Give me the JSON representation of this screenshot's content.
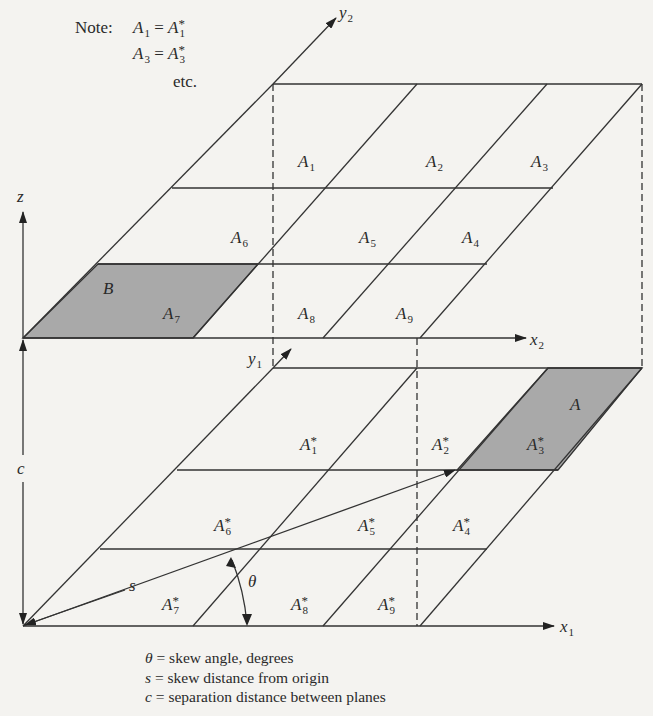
{
  "diagram": {
    "type": "two parallel skewed grid planes",
    "colors": {
      "background": "#f4f3f0",
      "line": "#333333",
      "shade": "#a9a9a9"
    },
    "note": {
      "prefix": "Note:",
      "lines": [
        {
          "lhs": "A",
          "lhs_sub": "1",
          "rhs": "A",
          "rhs_sup": "*",
          "rhs_sub": "1"
        },
        {
          "lhs": "A",
          "lhs_sub": "3",
          "rhs": "A",
          "rhs_sup": "*",
          "rhs_sub": "3"
        }
      ],
      "etc": "etc.",
      "eq": "="
    },
    "axes": {
      "z": "z",
      "y2": {
        "base": "y",
        "sub": "2"
      },
      "x2": {
        "base": "x",
        "sub": "2"
      },
      "y1": {
        "base": "y",
        "sub": "1"
      },
      "x1": {
        "base": "x",
        "sub": "1"
      },
      "c": "c",
      "s": "s",
      "theta": "θ"
    },
    "top_plane_cells": [
      {
        "base": "A",
        "sub": "1"
      },
      {
        "base": "A",
        "sub": "2"
      },
      {
        "base": "A",
        "sub": "3"
      },
      {
        "base": "A",
        "sub": "6"
      },
      {
        "base": "A",
        "sub": "5"
      },
      {
        "base": "A",
        "sub": "4"
      },
      {
        "base": "A",
        "sub": "7"
      },
      {
        "base": "A",
        "sub": "8"
      },
      {
        "base": "A",
        "sub": "9"
      }
    ],
    "top_shaded_label": "B",
    "bottom_plane_cells": [
      {
        "base": "A",
        "sup": "*",
        "sub": "1"
      },
      {
        "base": "A",
        "sup": "*",
        "sub": "2"
      },
      {
        "base": "A",
        "sup": "*",
        "sub": "3"
      },
      {
        "base": "A",
        "sup": "*",
        "sub": "6"
      },
      {
        "base": "A",
        "sup": "*",
        "sub": "5"
      },
      {
        "base": "A",
        "sup": "*",
        "sub": "4"
      },
      {
        "base": "A",
        "sup": "*",
        "sub": "7"
      },
      {
        "base": "A",
        "sup": "*",
        "sub": "8"
      },
      {
        "base": "A",
        "sup": "*",
        "sub": "9"
      }
    ],
    "bottom_shaded_label": "A",
    "legend": [
      {
        "sym": "θ",
        "text": " = skew angle, degrees"
      },
      {
        "sym": "s",
        "text": "  = skew distance from origin"
      },
      {
        "sym": "c",
        "text": " = separation distance between planes"
      }
    ]
  }
}
